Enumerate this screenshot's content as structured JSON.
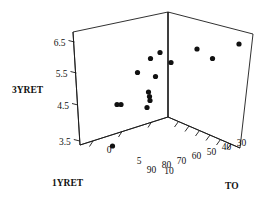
{
  "chart_data": {
    "type": "scatter",
    "title": "",
    "projection": "3d",
    "xlabel": "1YRET",
    "ylabel": "TO",
    "zlabel": "3YRET",
    "axes": {
      "x": {
        "name": "1YRET",
        "ticks": [
          "0",
          "5",
          "10"
        ],
        "values": [
          0,
          5,
          10
        ],
        "range": [
          -2.5,
          12.5
        ]
      },
      "y": {
        "name": "TO",
        "ticks": [
          "90",
          "80",
          "70",
          "60",
          "50",
          "40",
          "30"
        ],
        "values": [
          90,
          80,
          70,
          60,
          50,
          40,
          30
        ],
        "range": [
          95,
          27
        ],
        "reversed": true
      },
      "z": {
        "name": "3YRET",
        "ticks": [
          "6.5",
          "5.5",
          "4.5",
          "3.5"
        ],
        "values": [
          6.5,
          5.5,
          4.5,
          3.5
        ],
        "range": [
          3.1,
          6.9
        ]
      }
    },
    "grid": false,
    "legend": null,
    "marker": {
      "shape": "circle",
      "color": "#111111",
      "size": 2.6
    },
    "points": [
      {
        "px": 150.5,
        "py": 58.5
      },
      {
        "px": 160.0,
        "py": 52.5
      },
      {
        "px": 171.0,
        "py": 62.5
      },
      {
        "px": 137.5,
        "py": 72.5
      },
      {
        "px": 155.5,
        "py": 76.5
      },
      {
        "px": 117.0,
        "py": 104.5
      },
      {
        "px": 121.0,
        "py": 104.5
      },
      {
        "px": 148.5,
        "py": 92.0
      },
      {
        "px": 149.5,
        "py": 96.5
      },
      {
        "px": 150.0,
        "py": 100.5
      },
      {
        "px": 147.0,
        "py": 107.5
      },
      {
        "px": 112.5,
        "py": 146.0
      },
      {
        "px": 197.0,
        "py": 49.0
      },
      {
        "px": 212.5,
        "py": 58.5
      },
      {
        "px": 239.0,
        "py": 44.0
      }
    ]
  },
  "geometry": {
    "frame": {
      "apex": {
        "x": 168.0,
        "y": 12.0
      },
      "back_left": {
        "x": 73.0,
        "y": 32.0
      },
      "back_right": {
        "x": 253.0,
        "y": 34.0
      },
      "origin": {
        "x": 168.0,
        "y": 117.0
      },
      "floor_left": {
        "x": 80.0,
        "y": 145.0
      },
      "floor_right": {
        "x": 240.0,
        "y": 148.0
      }
    },
    "z_axis_ticks": [
      {
        "label": "6.5",
        "x": 74.5,
        "y": 42.0
      },
      {
        "label": "5.5",
        "x": 76.5,
        "y": 73.0
      },
      {
        "label": "4.5",
        "x": 78.0,
        "y": 105.0
      },
      {
        "label": "3.5",
        "x": 79.8,
        "y": 141.0
      }
    ],
    "x_axis_ticks": [
      {
        "label": "0",
        "x": 109.0,
        "y": 153.0
      },
      {
        "label": "5",
        "x": 139.0,
        "y": 163.5
      },
      {
        "label": "10",
        "x": 169.0,
        "y": 174.0
      }
    ],
    "y_axis_ticks": [
      {
        "label": "90",
        "x": 151.5,
        "y": 172.5
      },
      {
        "label": "80",
        "x": 166.5,
        "y": 168.0
      },
      {
        "label": "70",
        "x": 181.5,
        "y": 163.5
      },
      {
        "label": "60",
        "x": 196.5,
        "y": 159.0
      },
      {
        "label": "50",
        "x": 211.5,
        "y": 154.5
      },
      {
        "label": "40",
        "x": 226.5,
        "y": 150.0
      },
      {
        "label": "30",
        "x": 241.5,
        "y": 145.5
      }
    ],
    "labels": {
      "z_title": {
        "text": "3YRET",
        "x": 12.0,
        "y": 93.0
      },
      "x_title": {
        "text": "1YRET",
        "x": 52.0,
        "y": 186.0
      },
      "y_title": {
        "text": "TO",
        "x": 225.0,
        "y": 189.0
      }
    }
  }
}
